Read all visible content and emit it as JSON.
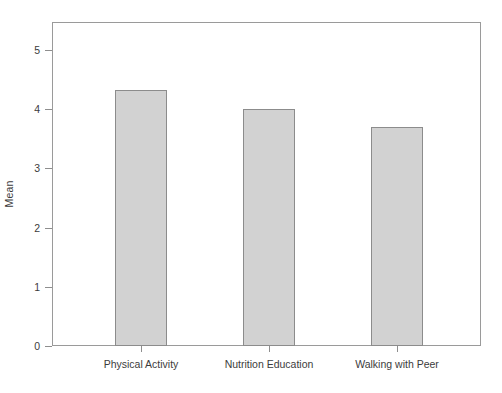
{
  "chart_data": {
    "type": "bar",
    "title": "",
    "xlabel": "",
    "ylabel": "Mean",
    "categories": [
      "Physical Activity",
      "Nutrition Education",
      "Walking with Peer"
    ],
    "values": [
      4.33,
      4.0,
      3.7
    ],
    "ylim": [
      0,
      5.5
    ],
    "yticks": [
      0,
      1,
      2,
      3,
      4,
      5
    ],
    "ytick_labels": [
      "0",
      "1",
      "2",
      "3",
      "4",
      "5"
    ],
    "grid": false,
    "legend": false,
    "bar_fill_color": "#d2d2d2",
    "bar_border_color": "#8c8c8c",
    "axis_color": "#9a9a9a",
    "text_color": "#3c3c3c"
  },
  "axis": {
    "y_label": "Mean",
    "y_ticks": [
      "5",
      "4",
      "3",
      "2",
      "1",
      "0"
    ],
    "x_labels": [
      "Physical Activity",
      "Nutrition Education",
      "Walking with Peer"
    ]
  }
}
